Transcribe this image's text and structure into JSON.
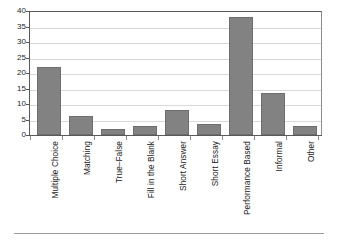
{
  "chart_data": {
    "type": "bar",
    "title": "",
    "subtitle": "",
    "xlabel": "",
    "ylabel": "",
    "ylim": [
      0,
      40
    ],
    "ytick_step": 5,
    "yticks": [
      0,
      5,
      10,
      15,
      20,
      25,
      30,
      35,
      40
    ],
    "ytick_labels": [
      "0",
      "5",
      "10",
      "15",
      "20",
      "25",
      "30",
      "35",
      "40"
    ],
    "grid": true,
    "grid_axis": "y",
    "legend": null,
    "legend_position": "none",
    "categories": [
      "Multiple Choice",
      "Matching",
      "True–False",
      "Fill in the Blank",
      "Short Answer",
      "Short Essay",
      "Performance Based",
      "Informal",
      "Other"
    ],
    "values": [
      22,
      6,
      2,
      3,
      8,
      3.5,
      38,
      13.5,
      3
    ],
    "series": [
      {
        "name": "Count",
        "values": [
          22,
          6,
          2,
          3,
          8,
          3.5,
          38,
          13.5,
          3
        ]
      }
    ],
    "bar_color": "#828282",
    "bar_edge_color": "#6e6e6e",
    "grid_color": "#d9d9d9",
    "axis_color": "#595959",
    "background": "#ffffff",
    "annotations": []
  },
  "figure": {
    "has_bottom_rule": true,
    "rule_color": "#9a9a9a"
  }
}
